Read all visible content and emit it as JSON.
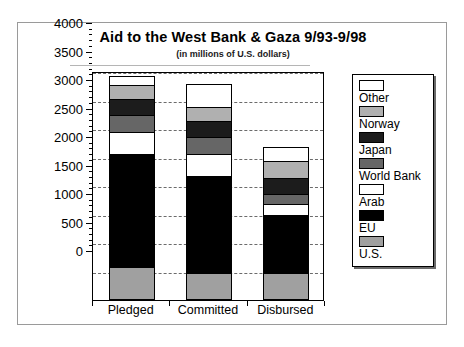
{
  "chart_data": {
    "type": "bar",
    "subtype": "stacked-vertical",
    "title": "Aid to the West Bank & Gaza 9/93-9/98",
    "subtitle": "(in millions of U.S. dollars)",
    "xlabel": "",
    "ylabel": "",
    "ylim": [
      0,
      4000
    ],
    "ytick_step": 500,
    "ytick_labels": [
      "4000",
      "3500",
      "3000",
      "2500",
      "2000",
      "1500",
      "1000",
      "500",
      "0"
    ],
    "ytick_values": [
      4000,
      3500,
      3000,
      2500,
      2000,
      1500,
      1000,
      500,
      0
    ],
    "minor_ticks_per_interval": 5,
    "grid": "horizontal-dashed",
    "legend_position": "right",
    "categories": [
      "Pledged",
      "Committed",
      "Disbursed"
    ],
    "series": [
      {
        "name": "U.S.",
        "color": "#a0a0a0",
        "values": [
          550,
          440,
          440
        ]
      },
      {
        "name": "EU",
        "color": "#000000",
        "values": [
          1970,
          1700,
          1010
        ]
      },
      {
        "name": "Arab",
        "color": "#ffffff",
        "values": [
          390,
          390,
          200
        ]
      },
      {
        "name": "World Bank",
        "color": "#666666",
        "values": [
          300,
          290,
          170
        ]
      },
      {
        "name": "Japan",
        "color": "#1c1c1c",
        "values": [
          290,
          290,
          290
        ]
      },
      {
        "name": "Norway",
        "color": "#b0b0b0",
        "values": [
          230,
          250,
          290
        ]
      },
      {
        "name": "Other",
        "color": "#ffffff",
        "values": [
          170,
          390,
          250
        ]
      }
    ],
    "totals": [
      3900,
      3750,
      2650
    ],
    "legend_entries": [
      {
        "label": "Other",
        "color": "#ffffff"
      },
      {
        "label": "Norway",
        "color": "#b0b0b0"
      },
      {
        "label": "Japan",
        "color": "#1c1c1c"
      },
      {
        "label": "World Bank",
        "color": "#666666"
      },
      {
        "label": "Arab",
        "color": "#ffffff"
      },
      {
        "label": "EU",
        "color": "#000000"
      },
      {
        "label": "U.S.",
        "color": "#a0a0a0"
      }
    ]
  }
}
